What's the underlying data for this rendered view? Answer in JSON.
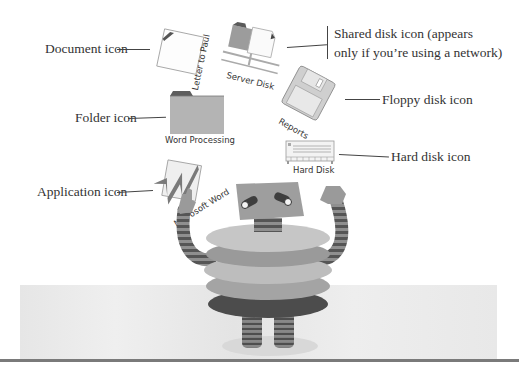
{
  "callouts": {
    "document": "Document icon",
    "shared_disk_line1": "Shared disk icon (appears",
    "shared_disk_line2": "only if you’re using a network)",
    "floppy": "Floppy disk icon",
    "folder": "Folder icon",
    "hard_disk": "Hard disk icon",
    "application": "Application icon"
  },
  "icons": {
    "document": {
      "label": "Letter to Paul",
      "type": "document-icon"
    },
    "server_disk": {
      "label": "Server Disk",
      "type": "shared-disk-icon"
    },
    "floppy": {
      "label": "Reports",
      "type": "floppy-disk-icon"
    },
    "folder": {
      "label": "Word Processing",
      "type": "folder-icon"
    },
    "hard_disk": {
      "label": "Hard Disk",
      "type": "hard-disk-icon"
    },
    "application": {
      "label": "Microsoft Word",
      "type": "application-icon"
    }
  },
  "colors": {
    "text": "#333333",
    "icon_gray": "#b8b8b8",
    "icon_dark": "#6e6e6e",
    "floor": "#e8e8e8",
    "rule": "#7a7a7a"
  }
}
